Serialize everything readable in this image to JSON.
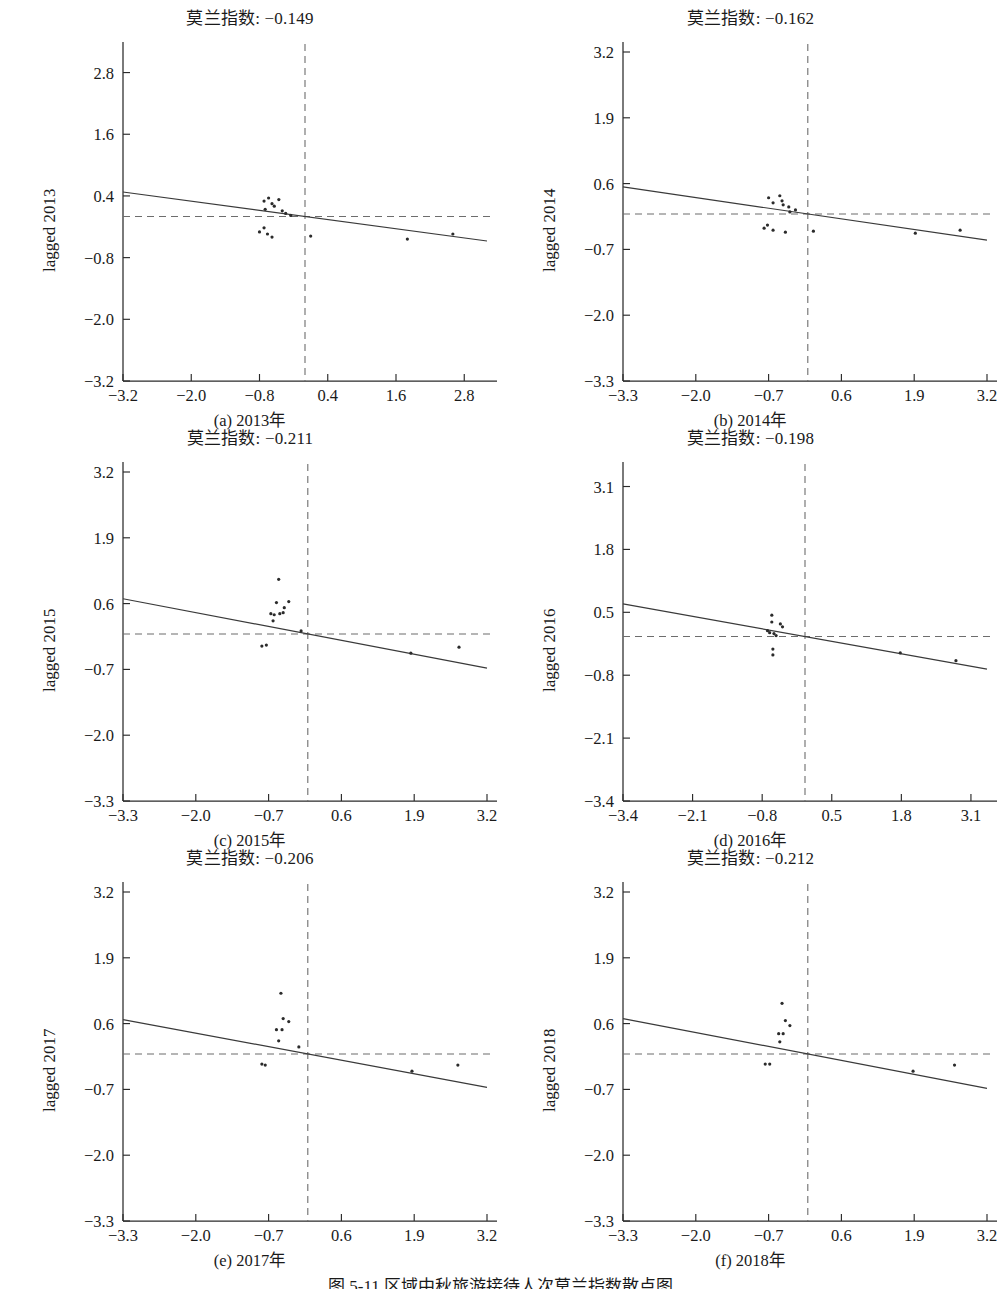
{
  "figure": {
    "caption": "图 5-11 区域中秋旅游接待人次莫兰指数散点图",
    "moran_label": "莫兰指数: "
  },
  "chart_data": [
    {
      "type": "scatter",
      "id": "panel-a",
      "title": "莫兰指数: −0.149",
      "moran_index": -0.149,
      "caption": "(a) 2013年",
      "ylabel": "lagged 2013",
      "xlabel": "",
      "xlim": [
        -3.2,
        3.2
      ],
      "ylim": [
        -3.2,
        3.2
      ],
      "xticks": [
        -3.2,
        -2.0,
        -0.8,
        0.4,
        1.6,
        2.8
      ],
      "yticks": [
        -3.2,
        -2.0,
        -0.8,
        0.4,
        1.6,
        2.8
      ],
      "xticklabels": [
        "−3.2",
        "−2.0",
        "−0.8",
        "0.4",
        "1.6",
        "2.8"
      ],
      "yticklabels": [
        "−3.2",
        "−2.0",
        "−0.8",
        "0.4",
        "1.6",
        "2.8"
      ],
      "grid": false,
      "legend": "none",
      "vline_x": 0.0,
      "hline_y": 0.0,
      "fit": {
        "intercept": 0.0,
        "slope": -0.149
      },
      "points": [
        [
          -0.72,
          0.3
        ],
        [
          -0.7,
          0.14
        ],
        [
          -0.64,
          0.36
        ],
        [
          -0.58,
          0.25
        ],
        [
          -0.54,
          0.2
        ],
        [
          -0.46,
          0.33
        ],
        [
          -0.4,
          0.11
        ],
        [
          -0.34,
          0.06
        ],
        [
          -0.25,
          0.02
        ],
        [
          -0.8,
          -0.3
        ],
        [
          -0.72,
          -0.22
        ],
        [
          -0.66,
          -0.34
        ],
        [
          -0.58,
          -0.4
        ],
        [
          0.1,
          -0.38
        ],
        [
          1.8,
          -0.44
        ],
        [
          2.6,
          -0.34
        ]
      ]
    },
    {
      "type": "scatter",
      "id": "panel-b",
      "title": "莫兰指数: −0.162",
      "moran_index": -0.162,
      "caption": "(b) 2014年",
      "ylabel": "lagged 2014",
      "xlabel": "",
      "xlim": [
        -3.3,
        3.2
      ],
      "ylim": [
        -3.3,
        3.2
      ],
      "xticks": [
        -3.3,
        -2.0,
        -0.7,
        0.6,
        1.9,
        3.2
      ],
      "yticks": [
        -3.3,
        -2.0,
        -0.7,
        0.6,
        1.9,
        3.2
      ],
      "xticklabels": [
        "−3.3",
        "−2.0",
        "−0.7",
        "0.6",
        "1.9",
        "3.2"
      ],
      "yticklabels": [
        "−3.3",
        "−2.0",
        "−0.7",
        "0.6",
        "1.9",
        "3.2"
      ],
      "grid": false,
      "legend": "none",
      "vline_x": 0.0,
      "hline_y": 0.0,
      "fit": {
        "intercept": 0.0,
        "slope": -0.162
      },
      "points": [
        [
          -0.7,
          0.32
        ],
        [
          -0.62,
          0.22
        ],
        [
          -0.5,
          0.36
        ],
        [
          -0.46,
          0.26
        ],
        [
          -0.44,
          0.18
        ],
        [
          -0.34,
          0.14
        ],
        [
          -0.32,
          0.04
        ],
        [
          -0.22,
          0.08
        ],
        [
          -0.78,
          -0.28
        ],
        [
          -0.72,
          -0.22
        ],
        [
          -0.62,
          -0.32
        ],
        [
          -0.4,
          -0.36
        ],
        [
          0.1,
          -0.34
        ],
        [
          1.92,
          -0.38
        ],
        [
          2.72,
          -0.32
        ]
      ]
    },
    {
      "type": "scatter",
      "id": "panel-c",
      "title": "莫兰指数: −0.211",
      "moran_index": -0.211,
      "caption": "(c) 2015年",
      "ylabel": "lagged 2015",
      "xlim": [
        -3.3,
        3.2
      ],
      "ylim": [
        -3.3,
        3.2
      ],
      "xticks": [
        -3.3,
        -2.0,
        -0.7,
        0.6,
        1.9,
        3.2
      ],
      "yticks": [
        -3.3,
        -2.0,
        -0.7,
        0.6,
        1.9,
        3.2
      ],
      "xticklabels": [
        "−3.3",
        "−2.0",
        "−0.7",
        "0.6",
        "1.9",
        "3.2"
      ],
      "yticklabels": [
        "−3.3",
        "−2.0",
        "−0.7",
        "0.6",
        "1.9",
        "3.2"
      ],
      "grid": false,
      "legend": "none",
      "vline_x": 0.0,
      "hline_y": 0.0,
      "fit": {
        "intercept": 0.0,
        "slope": -0.211
      },
      "points": [
        [
          -0.52,
          1.08
        ],
        [
          -0.56,
          0.62
        ],
        [
          -0.42,
          0.52
        ],
        [
          -0.34,
          0.64
        ],
        [
          -0.66,
          0.4
        ],
        [
          -0.6,
          0.38
        ],
        [
          -0.5,
          0.4
        ],
        [
          -0.44,
          0.42
        ],
        [
          -0.62,
          0.26
        ],
        [
          -0.12,
          0.06
        ],
        [
          -0.82,
          -0.24
        ],
        [
          -0.74,
          -0.22
        ],
        [
          1.84,
          -0.38
        ],
        [
          2.7,
          -0.26
        ]
      ]
    },
    {
      "type": "scatter",
      "id": "panel-d",
      "title": "莫兰指数: −0.198",
      "moran_index": -0.198,
      "caption": "(d) 2016年",
      "ylabel": "lagged 2016",
      "xlim": [
        -3.4,
        3.4
      ],
      "ylim": [
        -3.4,
        3.4
      ],
      "xticks": [
        -3.4,
        -2.1,
        -0.8,
        0.5,
        1.8,
        3.1
      ],
      "yticks": [
        -3.4,
        -2.1,
        -0.8,
        0.5,
        1.8,
        3.1
      ],
      "xticklabels": [
        "−3.4",
        "−2.1",
        "−0.8",
        "0.5",
        "1.8",
        "3.1"
      ],
      "yticklabels": [
        "−3.4",
        "−2.1",
        "−0.8",
        "0.5",
        "1.8",
        "3.1"
      ],
      "grid": false,
      "legend": "none",
      "vline_x": 0.0,
      "hline_y": 0.0,
      "fit": {
        "intercept": 0.0,
        "slope": -0.198
      },
      "points": [
        [
          -0.62,
          0.44
        ],
        [
          -0.62,
          0.3
        ],
        [
          -0.46,
          0.26
        ],
        [
          -0.42,
          0.2
        ],
        [
          -0.7,
          0.12
        ],
        [
          -0.66,
          0.08
        ],
        [
          -0.58,
          0.06
        ],
        [
          -0.54,
          0.02
        ],
        [
          -0.6,
          -0.26
        ],
        [
          -0.6,
          -0.38
        ],
        [
          1.78,
          -0.34
        ],
        [
          2.82,
          -0.5
        ]
      ]
    },
    {
      "type": "scatter",
      "id": "panel-e",
      "title": "莫兰指数: −0.206",
      "moran_index": -0.206,
      "caption": "(e) 2017年",
      "ylabel": "lagged 2017",
      "xlim": [
        -3.3,
        3.2
      ],
      "ylim": [
        -3.3,
        3.2
      ],
      "xticks": [
        -3.3,
        -2.0,
        -0.7,
        0.6,
        1.9,
        3.2
      ],
      "yticks": [
        -3.3,
        -2.0,
        -0.7,
        0.6,
        1.9,
        3.2
      ],
      "xticklabels": [
        "−3.3",
        "−2.0",
        "−0.7",
        "0.6",
        "1.9",
        "3.2"
      ],
      "yticklabels": [
        "−3.3",
        "−2.0",
        "−0.7",
        "0.6",
        "1.9",
        "3.2"
      ],
      "grid": false,
      "legend": "none",
      "vline_x": 0.0,
      "hline_y": 0.0,
      "fit": {
        "intercept": 0.0,
        "slope": -0.206
      },
      "points": [
        [
          -0.48,
          1.2
        ],
        [
          -0.44,
          0.7
        ],
        [
          -0.34,
          0.64
        ],
        [
          -0.56,
          0.48
        ],
        [
          -0.46,
          0.48
        ],
        [
          -0.52,
          0.26
        ],
        [
          -0.16,
          0.14
        ],
        [
          -0.82,
          -0.2
        ],
        [
          -0.76,
          -0.22
        ],
        [
          1.86,
          -0.34
        ],
        [
          2.68,
          -0.22
        ]
      ]
    },
    {
      "type": "scatter",
      "id": "panel-f",
      "title": "莫兰指数: −0.212",
      "moran_index": -0.212,
      "caption": "(f) 2018年",
      "ylabel": "lagged 2018",
      "xlim": [
        -3.3,
        3.2
      ],
      "ylim": [
        -3.3,
        3.2
      ],
      "xticks": [
        -3.3,
        -2.0,
        -0.7,
        0.6,
        1.9,
        3.2
      ],
      "yticks": [
        -3.3,
        -2.0,
        -0.7,
        0.6,
        1.9,
        3.2
      ],
      "xticklabels": [
        "−3.3",
        "−2.0",
        "−0.7",
        "0.6",
        "1.9",
        "3.2"
      ],
      "yticklabels": [
        "−3.3",
        "−2.0",
        "−0.7",
        "0.6",
        "1.9",
        "3.2"
      ],
      "grid": false,
      "legend": "none",
      "vline_x": 0.0,
      "hline_y": 0.0,
      "fit": {
        "intercept": 0.0,
        "slope": -0.212
      },
      "points": [
        [
          -0.46,
          1.0
        ],
        [
          -0.4,
          0.66
        ],
        [
          -0.32,
          0.56
        ],
        [
          -0.52,
          0.4
        ],
        [
          -0.44,
          0.4
        ],
        [
          -0.5,
          0.24
        ],
        [
          -0.76,
          -0.2
        ],
        [
          -0.68,
          -0.2
        ],
        [
          1.88,
          -0.34
        ],
        [
          2.62,
          -0.22
        ]
      ]
    }
  ]
}
